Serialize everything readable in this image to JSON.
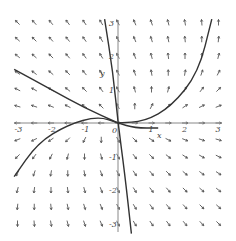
{
  "figure": {
    "type": "direction_field",
    "system": {
      "dx_dt": "x - y",
      "dy_dt": "2y"
    },
    "x_axis": {
      "label": "x",
      "ticks": [
        "-3",
        "-2",
        "-1",
        "1",
        "2",
        "3"
      ],
      "range": [
        -3,
        3
      ]
    },
    "y_axis": {
      "label": "y",
      "ticks": [
        "3",
        "2",
        "1",
        "-1",
        "-2",
        "-3"
      ],
      "range": [
        -3,
        3
      ]
    },
    "origin_label": "0",
    "colors": {
      "arrow": "#555555",
      "axis": "#888888",
      "curve": "#333333"
    },
    "grid_step": 0.5,
    "solution_curves": [
      {
        "name": "steep-curve",
        "points": [
          [
            -0.4,
            3.1
          ],
          [
            -0.15,
            1.5
          ],
          [
            0,
            0
          ],
          [
            0.2,
            -1.5
          ],
          [
            0.4,
            -3.3
          ]
        ]
      },
      {
        "name": "right-upper-curve",
        "points": [
          [
            2.8,
            3.1
          ],
          [
            2.4,
            1.5
          ],
          [
            1.6,
            0.5
          ],
          [
            0.8,
            0.05
          ],
          [
            0,
            0
          ]
        ]
      },
      {
        "name": "left-upper-curve",
        "points": [
          [
            -3.1,
            1.6
          ],
          [
            -2,
            1.0
          ],
          [
            -1,
            0.45
          ],
          [
            0,
            0
          ]
        ]
      },
      {
        "name": "left-lower-curve",
        "points": [
          [
            -3.1,
            -1.6
          ],
          [
            -2.4,
            -0.6
          ],
          [
            -1.5,
            -0.05
          ],
          [
            -0.6,
            0.2
          ],
          [
            0,
            0
          ],
          [
            0.5,
            -0.15
          ],
          [
            1.2,
            -0.15
          ]
        ]
      }
    ]
  }
}
